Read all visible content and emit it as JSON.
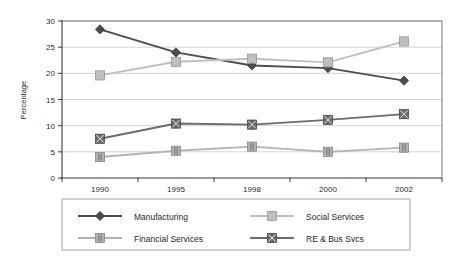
{
  "chart_data": {
    "type": "line",
    "title": "",
    "xlabel": "",
    "ylabel": "Percentage",
    "categories": [
      "1990",
      "1995",
      "1998",
      "2000",
      "2002"
    ],
    "ylim": [
      0,
      30
    ],
    "yticks": [
      "0",
      "5",
      "10",
      "15",
      "20",
      "25",
      "30"
    ],
    "grid": true,
    "legend_position": "bottom",
    "series": [
      {
        "name": "Manufacturing",
        "marker": "diamond",
        "color": "#4d4d4d",
        "values": [
          28.4,
          24.0,
          21.5,
          21.0,
          18.6
        ]
      },
      {
        "name": "Social Services",
        "marker": "square",
        "color": "#bfbfbf",
        "values": [
          19.6,
          22.2,
          22.8,
          22.1,
          26.1
        ]
      },
      {
        "name": "Financial Services",
        "marker": "square-hatch",
        "color": "#b3b3b3",
        "values": [
          4.0,
          5.2,
          6.0,
          5.0,
          5.8
        ]
      },
      {
        "name": "RE & Bus Svcs",
        "marker": "square-x",
        "color": "#6b6b6b",
        "values": [
          7.5,
          10.4,
          10.2,
          11.1,
          12.2
        ]
      }
    ]
  },
  "colors": {
    "axis": "#3a3a3a",
    "grid": "#c8c8c8",
    "border": "#6e6e6e",
    "plot_background": "#ffffff",
    "legend_border": "#9a9a9a"
  }
}
